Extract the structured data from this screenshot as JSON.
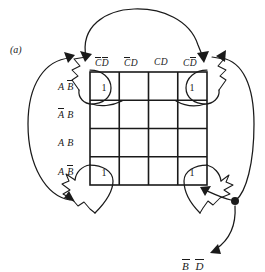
{
  "figure": {
    "label": "(a)",
    "type": "karnaugh-map",
    "caption_fragment": "B D"
  },
  "kmap": {
    "column_headers": [
      {
        "id": "c0",
        "text": "C D",
        "c_bar": true,
        "d_bar": true
      },
      {
        "id": "c1",
        "text": "C D",
        "c_bar": true,
        "d_bar": false
      },
      {
        "id": "c2",
        "text": "C D",
        "c_bar": false,
        "d_bar": false
      },
      {
        "id": "c3",
        "text": "C D",
        "c_bar": false,
        "d_bar": true
      }
    ],
    "row_headers": [
      {
        "id": "r0",
        "text": "A B",
        "a_bar": true,
        "b_bar": true
      },
      {
        "id": "r1",
        "text": "A B",
        "a_bar": true,
        "b_bar": false
      },
      {
        "id": "r2",
        "text": "A B",
        "a_bar": false,
        "b_bar": false
      },
      {
        "id": "r3",
        "text": "A B",
        "a_bar": false,
        "b_bar": true
      }
    ],
    "cells": [
      [
        "1",
        "",
        "",
        "1"
      ],
      [
        "",
        "",
        "",
        ""
      ],
      [
        "",
        "",
        "",
        ""
      ],
      [
        "1",
        "",
        "",
        "1"
      ]
    ],
    "grouping_note": "four-corner group",
    "colors": {
      "ink": "#1a1a1a",
      "paper": "#ffffff"
    }
  },
  "annotations": {
    "top_arc": "links-top-left-to-top-right-corner",
    "left_arc": "links-top-left-to-bottom-left-corner",
    "right_arc": "links-top-right-to-bottom-right-corner",
    "junction_dot": "wire-junction",
    "callout_arrow": "points-to-term-label"
  }
}
